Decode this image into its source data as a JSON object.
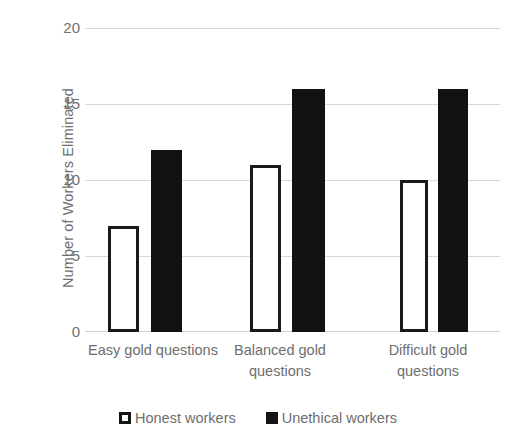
{
  "chart_data": {
    "type": "bar",
    "title": "",
    "xlabel": "",
    "ylabel": "Number of Workers Eliminated",
    "ylim": [
      0,
      20
    ],
    "yticks": [
      0,
      5,
      10,
      15,
      20
    ],
    "ytick_labels": [
      "0",
      "5",
      "10",
      "15",
      "20"
    ],
    "grid": true,
    "legend_position": "bottom",
    "categories": [
      "Easy gold questions",
      "Balanced gold questions",
      "Difficult gold questions"
    ],
    "series": [
      {
        "name": "Honest workers",
        "values": [
          7,
          11,
          10
        ],
        "color": "#ffffff",
        "edge_color": "#1a1a1a"
      },
      {
        "name": "Unethical workers",
        "values": [
          12,
          16,
          16
        ],
        "color": "#111111",
        "edge_color": "#111111"
      }
    ]
  },
  "colors": {
    "gridline": "#d9d9d9",
    "text": "#6e6e6e",
    "background": "#ffffff"
  }
}
